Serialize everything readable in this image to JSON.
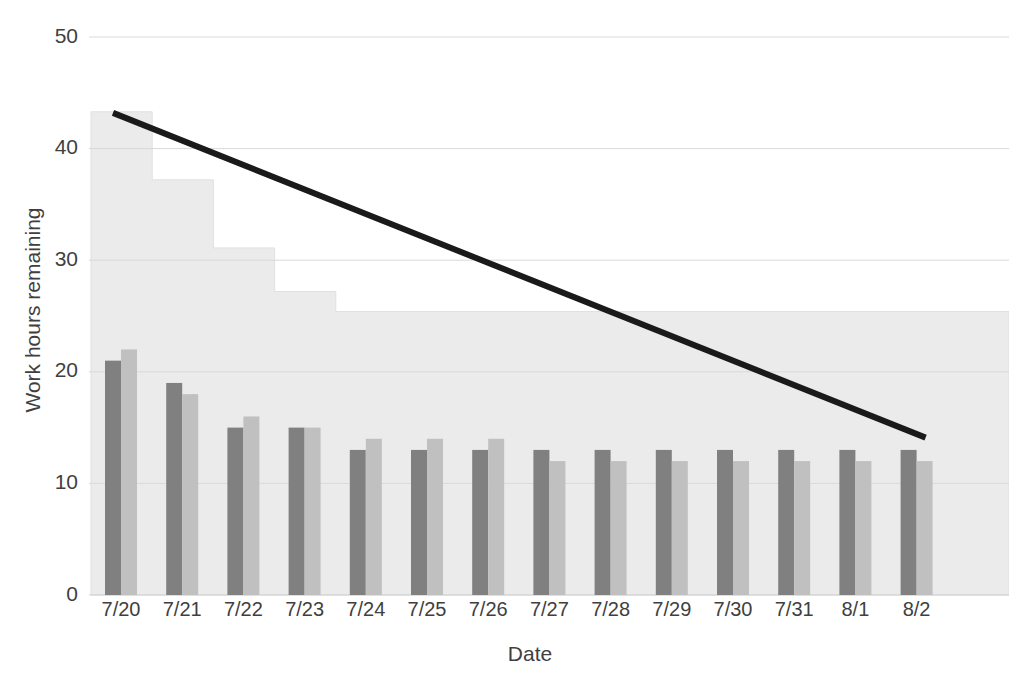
{
  "chart_data": {
    "type": "bar",
    "title": "",
    "xlabel": "Date",
    "ylabel": "Work hours remaining",
    "categories": [
      "7/20",
      "7/21",
      "7/22",
      "7/23",
      "7/24",
      "7/25",
      "7/26",
      "7/27",
      "7/28",
      "7/29",
      "7/30",
      "7/31",
      "8/1",
      "8/2"
    ],
    "ylim": [
      0,
      50
    ],
    "yticks": [
      0,
      10,
      20,
      30,
      40,
      50
    ],
    "ytick_labels": [
      "0",
      "10",
      "20",
      "30",
      "40",
      "50"
    ],
    "grid": true,
    "legend": "none",
    "series": [
      {
        "name": "dark-bars",
        "type": "bar",
        "color": "#808080",
        "values": [
          21,
          19,
          15,
          15,
          13,
          13,
          13,
          13,
          13,
          13,
          13,
          13,
          13,
          13
        ]
      },
      {
        "name": "light-bars",
        "type": "bar",
        "color": "#c0c0c0",
        "values": [
          22,
          18,
          16,
          15,
          14,
          14,
          14,
          12,
          12,
          12,
          12,
          12,
          12,
          12
        ]
      },
      {
        "name": "step-area",
        "type": "area",
        "color": "#ebebeb",
        "values": [
          43.3,
          37.2,
          31.1,
          27.2,
          25.4,
          25.4,
          25.4,
          25.4,
          25.4,
          25.4,
          25.4,
          25.4,
          25.4,
          25.4
        ]
      },
      {
        "name": "ideal-line",
        "type": "line",
        "color": "#1a1a1a",
        "x": [
          "7/20",
          "8/2"
        ],
        "values": [
          43.2,
          14.1
        ]
      }
    ]
  },
  "axes": {
    "y_title": "Work hours remaining",
    "x_title": "Date"
  }
}
